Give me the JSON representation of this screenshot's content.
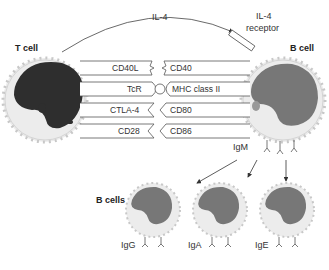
{
  "diagram": {
    "cytokine": "IL-4",
    "receptor_line1": "IL-4",
    "receptor_line2": "receptor",
    "t_cell_label": "T cell",
    "b_cell_label": "B cell",
    "b_cells_label": "B cells",
    "t_cell_molecules": [
      "CD40L",
      "TcR",
      "CTLA-4",
      "CD28"
    ],
    "b_cell_molecules": [
      "CD40",
      "MHC class II",
      "CD80",
      "CD86"
    ],
    "membrane_antibody": "IgM",
    "switched_isotypes": [
      "IgG",
      "IgA",
      "IgE"
    ],
    "colors": {
      "t_nucleus": "#2e2e2e",
      "b_nucleus": "#777777",
      "cytoplasm": "#ececec",
      "cell_border": "#c8c8c8"
    }
  }
}
